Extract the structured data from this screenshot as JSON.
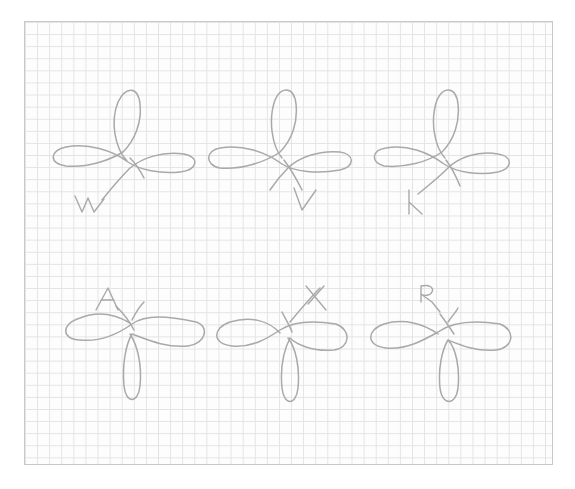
{
  "colors": {
    "paper": "#fdfdfd",
    "grid": "#e3e3e3",
    "border": "#c9c9c9",
    "pencil": "#a9a9a9"
  },
  "rows": [
    {
      "position": "top",
      "loop_direction": "up",
      "motifs": [
        {
          "label": "W"
        },
        {
          "label": "V"
        },
        {
          "label": "K"
        }
      ]
    },
    {
      "position": "bottom",
      "loop_direction": "down",
      "motifs": [
        {
          "label": "A"
        },
        {
          "label": "X"
        },
        {
          "label": "R"
        }
      ]
    }
  ]
}
